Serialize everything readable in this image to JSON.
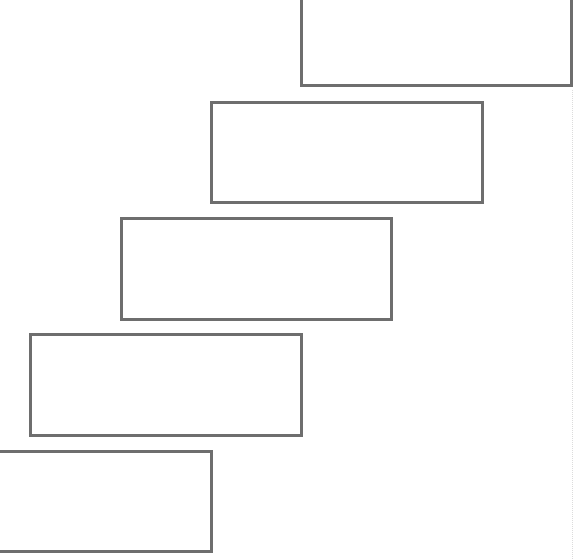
{
  "diagram": {
    "type": "staircase",
    "border_color": "#6e6e6e",
    "background": "#ffffff",
    "steps": [
      {
        "id": "step-1",
        "label": "",
        "x": 300,
        "y": -5,
        "w": 273,
        "h": 92
      },
      {
        "id": "step-2",
        "label": "",
        "x": 210,
        "y": 101,
        "w": 274,
        "h": 103
      },
      {
        "id": "step-3",
        "label": "",
        "x": 120,
        "y": 217,
        "w": 273,
        "h": 104
      },
      {
        "id": "step-4",
        "label": "",
        "x": 29,
        "y": 333,
        "w": 274,
        "h": 104
      },
      {
        "id": "step-5",
        "label": "",
        "x": -10,
        "y": 450,
        "w": 223,
        "h": 103
      }
    ]
  }
}
